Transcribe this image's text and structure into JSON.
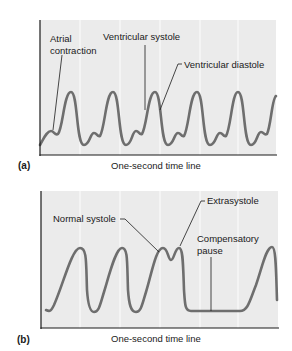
{
  "colors": {
    "panel_bg": "#ebebeb",
    "gridline": "#fafafa",
    "trace": "#6e6e6e",
    "axis": "#1a1a1a",
    "text": "#1a1a1a"
  },
  "panel_a": {
    "label": "(a)",
    "xlabel": "One-second time line",
    "annotations": {
      "atrial_1": "Atrial",
      "atrial_2": "contraction",
      "ventricular_systole": "Ventricular systole",
      "ventricular_diastole": "Ventricular diastole"
    }
  },
  "panel_b": {
    "label": "(b)",
    "xlabel": "One-second time line",
    "annotations": {
      "normal_systole": "Normal systole",
      "extrasystole": "Extrasystole",
      "compensatory_1": "Compensatory",
      "compensatory_2": "pause"
    }
  }
}
